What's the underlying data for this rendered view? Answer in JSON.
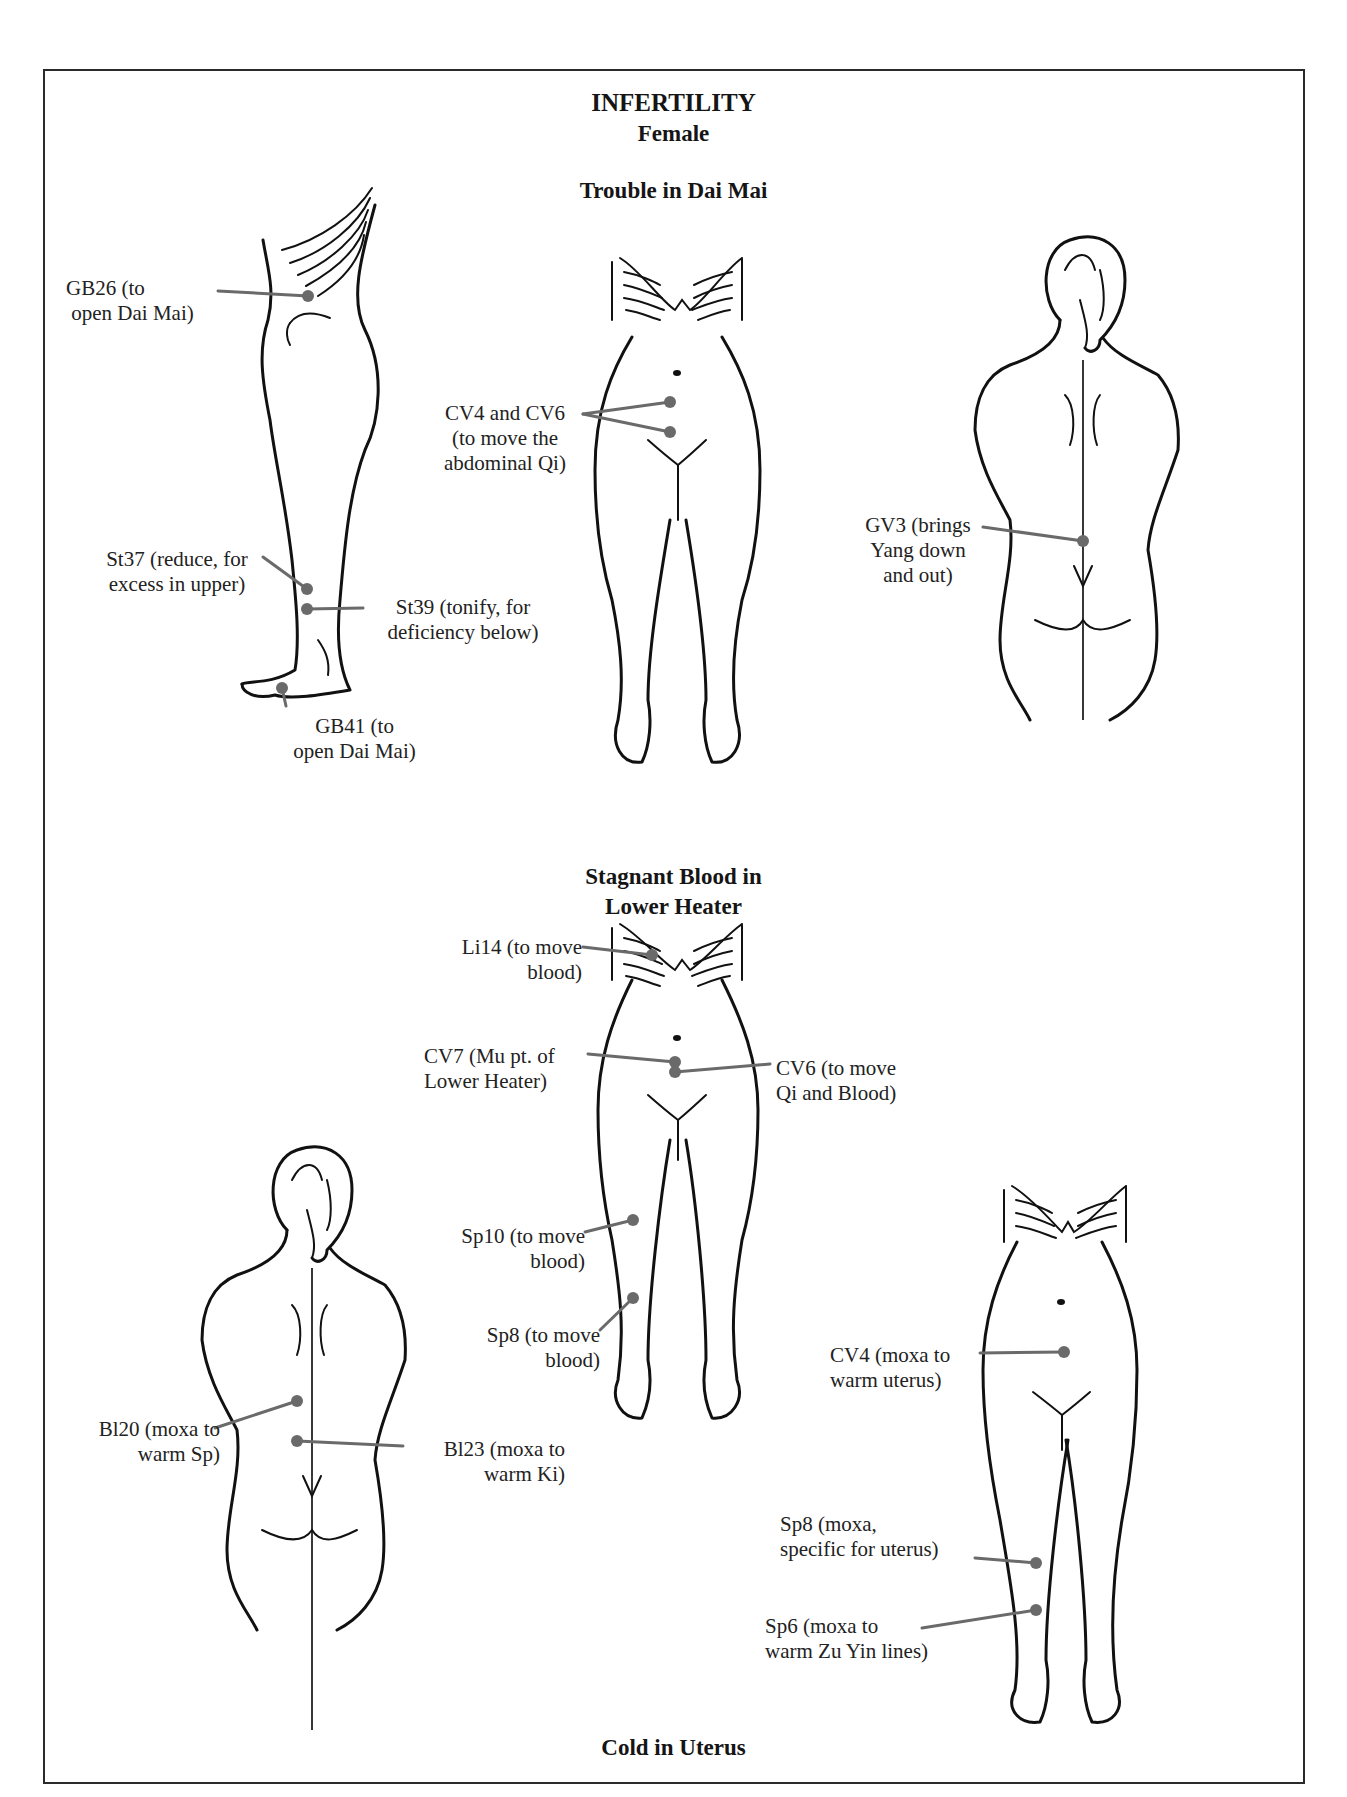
{
  "page": {
    "title": "INFERTILITY",
    "subtitle": "Female"
  },
  "sections": {
    "dai_mai": {
      "heading": "Trouble in Dai Mai"
    },
    "stagnant_blood": {
      "heading_line1": "Stagnant Blood in",
      "heading_line2": "Lower Heater"
    },
    "cold_uterus": {
      "heading": "Cold in Uterus"
    }
  },
  "labels": {
    "gb26": "GB26 (to\n open Dai Mai)",
    "cv4_cv6": "CV4 and CV6\n(to move the\nabdominal Qi)",
    "gv3": "GV3 (brings\nYang down\nand out)",
    "st37": "St37 (reduce, for\nexcess in upper)",
    "st39": "St39 (tonify, for\ndeficiency below)",
    "gb41": "GB41 (to\nopen Dai Mai)",
    "li14": "Li14 (to move\nblood)",
    "cv7": "CV7 (Mu pt. of\nLower Heater)",
    "cv6_blood": "CV6 (to move\nQi and Blood)",
    "sp10": "Sp10 (to move\nblood)",
    "sp8_blood": "Sp8 (to move\nblood)",
    "bl20": "Bl20 (moxa to\nwarm Sp)",
    "bl23": "Bl23 (moxa to\nwarm Ki)",
    "cv4_moxa": "CV4 (moxa to\nwarm uterus)",
    "sp8_moxa": "Sp8 (moxa,\nspecific for uterus)",
    "sp6_moxa": "Sp6 (moxa to\nwarm Zu Yin lines)"
  },
  "colors": {
    "point": "#6a6a6a",
    "outline": "#111111",
    "border": "#2a2a2a"
  }
}
